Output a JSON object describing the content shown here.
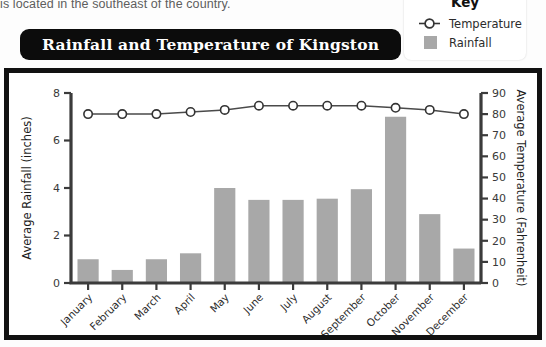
{
  "page_text": "is located in the southeast of the country.",
  "title": "Rainfall and Temperature of Kingston",
  "key": {
    "heading": "Key",
    "items": [
      {
        "label": "Temperature",
        "symbol": "circle-marker-icon",
        "color": "#ffffff"
      },
      {
        "label": "Rainfall",
        "symbol": "gray-square-icon",
        "color": "#a8a8a8"
      }
    ]
  },
  "chart_data": {
    "type": "bar",
    "title": "Rainfall and Temperature of Kingston",
    "categories": [
      "January",
      "February",
      "March",
      "April",
      "May",
      "June",
      "July",
      "August",
      "September",
      "October",
      "November",
      "December"
    ],
    "series": [
      {
        "name": "Rainfall",
        "type": "bar",
        "axis": "left",
        "unit": "inches",
        "color": "#a8a8a8",
        "values": [
          1.0,
          0.55,
          1.0,
          1.25,
          4.0,
          3.5,
          3.5,
          3.55,
          3.95,
          7.0,
          2.9,
          1.45
        ]
      },
      {
        "name": "Temperature",
        "type": "line",
        "axis": "right",
        "unit": "Fahrenheit",
        "color": "#4a4a4a",
        "values": [
          80,
          80,
          80,
          81,
          82,
          84,
          84,
          84,
          84,
          83,
          82,
          80
        ]
      }
    ],
    "xlabel": "",
    "ylabel": "Average Rainfall (inches)",
    "y2label": "Average Temperature (Fahrenheit)",
    "ylim": [
      0,
      8
    ],
    "y2lim": [
      0,
      90
    ],
    "yticks": [
      0,
      2,
      4,
      6,
      8
    ],
    "y2ticks": [
      0,
      10,
      20,
      30,
      40,
      50,
      60,
      70,
      80,
      90
    ],
    "grid": false,
    "legend_position": "top-right"
  }
}
